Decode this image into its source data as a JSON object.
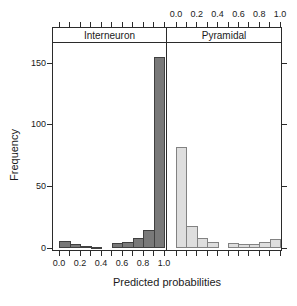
{
  "figure": {
    "background": "#ffffff",
    "border_color": "#2b2b2b",
    "text_color": "#1a1a1a"
  },
  "chart_data": {
    "type": "bar",
    "subtype": "lattice-histogram",
    "title": "",
    "xlabel": "Predicted probabilities",
    "ylabel": "Frequency",
    "grid": false,
    "legend": false,
    "bin_edges": [
      0.0,
      0.1,
      0.2,
      0.3,
      0.4,
      0.5,
      0.6,
      0.7,
      0.8,
      0.9,
      1.0
    ],
    "x_tick_values": [
      0.0,
      0.1,
      0.2,
      0.3,
      0.4,
      0.5,
      0.6,
      0.7,
      0.8,
      0.9,
      1.0
    ],
    "x_tick_labels": [
      "0.0",
      "",
      "0.2",
      "",
      "0.4",
      "",
      "0.6",
      "",
      "0.8",
      "",
      "1.0"
    ],
    "y_tick_values": [
      0,
      50,
      100,
      150
    ],
    "y_tick_labels": [
      "0",
      "50",
      "100",
      "150"
    ],
    "xlim": [
      -0.07,
      1.07
    ],
    "ylim": [
      0,
      165
    ],
    "panels": [
      {
        "label": "Interneuron",
        "x_labels_position": "bottom",
        "bar_fill": "#797979",
        "bar_border": "#404040",
        "frequencies": [
          6,
          3,
          2,
          1,
          0,
          4,
          5,
          8,
          15,
          155
        ]
      },
      {
        "label": "Pyramidal",
        "x_labels_position": "top",
        "bar_fill": "#dedede",
        "bar_border": "#828282",
        "frequencies": [
          82,
          18,
          8,
          5,
          0,
          4,
          3,
          3,
          5,
          7
        ]
      }
    ]
  }
}
